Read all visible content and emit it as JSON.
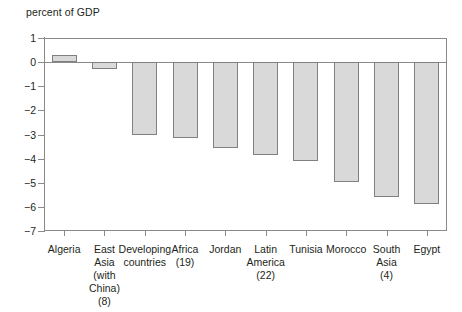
{
  "chart_data": {
    "type": "bar",
    "title": "",
    "ylabel": "percent of GDP",
    "xlabel": "",
    "ylim": [
      -7,
      1
    ],
    "yticks": [
      1,
      0,
      -1,
      -2,
      -3,
      -4,
      -5,
      -6,
      -7
    ],
    "ytick_labels": [
      "1",
      "0",
      "−1",
      "−2",
      "−3",
      "−4",
      "−5",
      "−6",
      "−7"
    ],
    "grid": false,
    "legend": "none",
    "bar_fill_color": "#d9d9d9",
    "bar_edge_color": "#808080",
    "categories": [
      "Algeria",
      "East\nAsia\n(with China)\n(8)",
      "Developing\ncountries",
      "Africa\n(19)",
      "Jordan",
      "Latin\nAmerica\n(22)",
      "Tunisia",
      "Morocco",
      "South\nAsia\n(4)",
      "Egypt"
    ],
    "values": [
      0.3,
      -0.3,
      -3.0,
      -3.15,
      -3.55,
      -3.85,
      -4.1,
      -4.95,
      -5.6,
      -5.9
    ]
  }
}
